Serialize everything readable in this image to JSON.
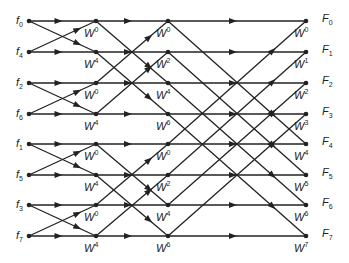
{
  "diagram": {
    "type": "FFT butterfly (8-point, decimation in time)",
    "inputs": [
      {
        "name": "f",
        "sub": "0"
      },
      {
        "name": "f",
        "sub": "4"
      },
      {
        "name": "f",
        "sub": "2"
      },
      {
        "name": "f",
        "sub": "6"
      },
      {
        "name": "f",
        "sub": "1"
      },
      {
        "name": "f",
        "sub": "5"
      },
      {
        "name": "f",
        "sub": "3"
      },
      {
        "name": "f",
        "sub": "7"
      }
    ],
    "outputs": [
      {
        "name": "F",
        "sub": "0"
      },
      {
        "name": "F",
        "sub": "1"
      },
      {
        "name": "F",
        "sub": "2"
      },
      {
        "name": "F",
        "sub": "3"
      },
      {
        "name": "F",
        "sub": "4"
      },
      {
        "name": "F",
        "sub": "5"
      },
      {
        "name": "F",
        "sub": "6"
      },
      {
        "name": "F",
        "sub": "7"
      }
    ],
    "stage1_twiddles": [
      "0",
      "4",
      "0",
      "4",
      "0",
      "4",
      "0",
      "4"
    ],
    "stage2_twiddles": [
      "0",
      "2",
      "4",
      "6",
      "0",
      "2",
      "4",
      "6"
    ],
    "stage3_twiddles": [
      "0",
      "1",
      "2",
      "3",
      "4",
      "5",
      "6",
      "7"
    ],
    "twiddle_symbol": "W",
    "colors": {
      "line": "#222222",
      "background": "#ffffff"
    }
  }
}
